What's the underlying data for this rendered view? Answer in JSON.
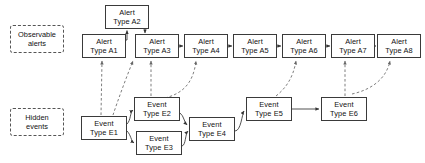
{
  "diagram": {
    "legend": [
      {
        "id": "legend-observable",
        "line1": "Observable",
        "line2": "alerts",
        "x": 10,
        "y": 25
      },
      {
        "id": "legend-hidden",
        "line1": "Hidden",
        "line2": "events",
        "x": 10,
        "y": 108
      }
    ],
    "alerts": [
      {
        "id": "alert-a2",
        "line1": "Alert",
        "line2": "Type A2",
        "x": 105,
        "y": 5
      },
      {
        "id": "alert-a1",
        "line1": "Alert",
        "line2": "Type A1",
        "x": 82,
        "y": 34
      },
      {
        "id": "alert-a3",
        "line1": "Alert",
        "line2": "Type A3",
        "x": 135,
        "y": 34
      },
      {
        "id": "alert-a4",
        "line1": "Alert",
        "line2": "Type A4",
        "x": 184,
        "y": 34
      },
      {
        "id": "alert-a5",
        "line1": "Alert",
        "line2": "Type A5",
        "x": 233,
        "y": 34
      },
      {
        "id": "alert-a6",
        "line1": "Alert",
        "line2": "Type A6",
        "x": 282,
        "y": 34
      },
      {
        "id": "alert-a7",
        "line1": "Alert",
        "line2": "Type A7",
        "x": 331,
        "y": 34
      },
      {
        "id": "alert-a8",
        "line1": "Alert",
        "line2": "Type A8",
        "x": 377,
        "y": 34
      }
    ],
    "events": [
      {
        "id": "event-e1",
        "line1": "Event",
        "line2": "Type E1",
        "x": 81,
        "y": 116
      },
      {
        "id": "event-e2",
        "line1": "Event",
        "line2": "Type E2",
        "x": 134,
        "y": 97
      },
      {
        "id": "event-e3",
        "line1": "Event",
        "line2": "Type E3",
        "x": 136,
        "y": 131
      },
      {
        "id": "event-e4",
        "line1": "Event",
        "line2": "Type E4",
        "x": 189,
        "y": 117
      },
      {
        "id": "event-e5",
        "line1": "Event",
        "line2": "Type E5",
        "x": 246,
        "y": 97
      },
      {
        "id": "event-e6",
        "line1": "Event",
        "line2": "Type E6",
        "x": 321,
        "y": 97
      }
    ],
    "solid_edges": [
      {
        "id": "edge-a1-a2",
        "from": "alert-a1",
        "to": "alert-a2"
      },
      {
        "id": "edge-a2-a3",
        "from": "alert-a2",
        "to": "alert-a3"
      },
      {
        "id": "edge-a3-a4",
        "from": "alert-a3",
        "to": "alert-a4"
      },
      {
        "id": "edge-a4-a5",
        "from": "alert-a4",
        "to": "alert-a5"
      },
      {
        "id": "edge-a5-a6",
        "from": "alert-a5",
        "to": "alert-a6"
      },
      {
        "id": "edge-a6-a7",
        "from": "alert-a6",
        "to": "alert-a7"
      },
      {
        "id": "edge-a7-a8",
        "from": "alert-a7",
        "to": "alert-a8"
      },
      {
        "id": "edge-e1-e2",
        "from": "event-e1",
        "to": "event-e2"
      },
      {
        "id": "edge-e1-e3",
        "from": "event-e1",
        "to": "event-e3"
      },
      {
        "id": "edge-e2-e4",
        "from": "event-e2",
        "to": "event-e4"
      },
      {
        "id": "edge-e3-e4",
        "from": "event-e3",
        "to": "event-e4"
      },
      {
        "id": "edge-e4-e5",
        "from": "event-e4",
        "to": "event-e5"
      },
      {
        "id": "edge-e5-e6",
        "from": "event-e5",
        "to": "event-e6"
      }
    ],
    "dashed_edges": [
      {
        "id": "edge-e1-a1",
        "from": "event-e1",
        "to": "alert-a1"
      },
      {
        "id": "edge-e1-a3",
        "from": "event-e1",
        "to": "alert-a3"
      },
      {
        "id": "edge-e2-a3",
        "from": "event-e2",
        "to": "alert-a3"
      },
      {
        "id": "edge-e2-a4",
        "from": "event-e2",
        "to": "alert-a4"
      },
      {
        "id": "edge-e5-a6",
        "from": "event-e5",
        "to": "alert-a6"
      },
      {
        "id": "edge-e6-a7",
        "from": "event-e6",
        "to": "alert-a7"
      },
      {
        "id": "edge-e6-a8",
        "from": "event-e6",
        "to": "alert-a8"
      }
    ],
    "colors": {
      "node_border": "#3a3a3a",
      "node_fill": "#ffffff",
      "legend_border": "#555555",
      "solid_edge": "#333333",
      "dashed_edge": "#666666",
      "text": "#111111",
      "background": "#ffffff"
    }
  }
}
